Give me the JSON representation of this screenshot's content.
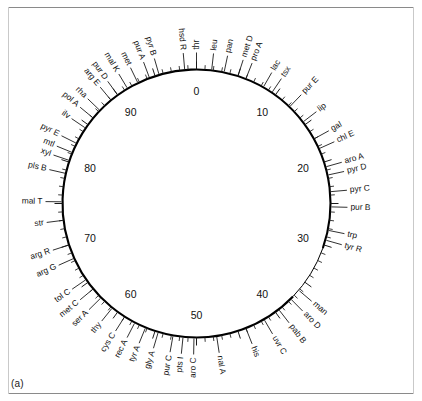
{
  "figure": {
    "panel_label": "(a)",
    "units": "minutes",
    "scale_max": 100
  },
  "scale_labels": [
    {
      "value": "0",
      "position": 0
    },
    {
      "value": "10",
      "position": 10
    },
    {
      "value": "20",
      "position": 20
    },
    {
      "value": "30",
      "position": 30
    },
    {
      "value": "40",
      "position": 40
    },
    {
      "value": "50",
      "position": 50
    },
    {
      "value": "60",
      "position": 60
    },
    {
      "value": "70",
      "position": 70
    },
    {
      "value": "80",
      "position": 80
    },
    {
      "value": "90",
      "position": 90
    }
  ],
  "genes": [
    {
      "label": "hsd R",
      "position": 98.6
    },
    {
      "label": "thr",
      "position": 0.0
    },
    {
      "label": "leu",
      "position": 1.8
    },
    {
      "label": "pan",
      "position": 3.3
    },
    {
      "label": "met D",
      "position": 5.0
    },
    {
      "label": "pro A",
      "position": 6.0
    },
    {
      "label": "lac",
      "position": 8.3
    },
    {
      "label": "tsx",
      "position": 9.5
    },
    {
      "label": "pur E",
      "position": 12.2
    },
    {
      "label": "lip",
      "position": 14.6
    },
    {
      "label": "gal",
      "position": 17.0
    },
    {
      "label": "chl E",
      "position": 18.3
    },
    {
      "label": "aro A",
      "position": 20.6
    },
    {
      "label": "pyr D",
      "position": 21.6
    },
    {
      "label": "pyr C",
      "position": 23.6
    },
    {
      "label": "pur B",
      "position": 25.4
    },
    {
      "label": "trp",
      "position": 28.2
    },
    {
      "label": "tyr R",
      "position": 29.4
    },
    {
      "label": "man",
      "position": 36.2
    },
    {
      "label": "aro D",
      "position": 37.6
    },
    {
      "label": "pab B",
      "position": 39.5
    },
    {
      "label": "uvr C",
      "position": 41.6
    },
    {
      "label": "his",
      "position": 44.0
    },
    {
      "label": "nal A",
      "position": 47.6
    },
    {
      "label": "aro C",
      "position": 50.3
    },
    {
      "label": "pts I",
      "position": 51.6
    },
    {
      "label": "pur C",
      "position": 52.8
    },
    {
      "label": "gly A",
      "position": 54.6
    },
    {
      "label": "tyr A",
      "position": 56.2
    },
    {
      "label": "rec A",
      "position": 57.6
    },
    {
      "label": "cys C",
      "position": 59.0
    },
    {
      "label": "thy",
      "position": 60.8
    },
    {
      "label": "ser A",
      "position": 62.6
    },
    {
      "label": "met C",
      "position": 64.0
    },
    {
      "label": "tol C",
      "position": 65.4
    },
    {
      "label": "arg G",
      "position": 68.3
    },
    {
      "label": "arg R",
      "position": 70.0
    },
    {
      "label": "str",
      "position": 73.0
    },
    {
      "label": "mal T",
      "position": 75.2
    },
    {
      "label": "pls B",
      "position": 78.6
    },
    {
      "label": "xyl",
      "position": 80.2
    },
    {
      "label": "mtl",
      "position": 81.2
    },
    {
      "label": "pyr E",
      "position": 82.4
    },
    {
      "label": "ilv",
      "position": 84.5
    },
    {
      "label": "pol A",
      "position": 86.0
    },
    {
      "label": "rha",
      "position": 87.2
    },
    {
      "label": "arg E",
      "position": 89.0
    },
    {
      "label": "pur D",
      "position": 90.0
    },
    {
      "label": "mal K",
      "position": 91.4
    },
    {
      "label": "met",
      "position": 92.8
    },
    {
      "label": "pur A",
      "position": 94.3
    },
    {
      "label": "pyr B",
      "position": 95.5
    }
  ],
  "colors": {
    "ring": "#000000",
    "text": "#111111",
    "background": "#ffffff",
    "frame": "#8a8a8a"
  },
  "chart_data": {
    "type": "scatter",
    "xlabel": "Map position (minutes)",
    "ylabel": "",
    "xlim": [
      0,
      100
    ],
    "grid": false,
    "legend": "none",
    "categories": [
      "hsd R",
      "thr",
      "leu",
      "pan",
      "met D",
      "pro A",
      "lac",
      "tsx",
      "pur E",
      "lip",
      "gal",
      "chl E",
      "aro A",
      "pyr D",
      "pyr C",
      "pur B",
      "trp",
      "tyr R",
      "man",
      "aro D",
      "pab B",
      "uvr C",
      "his",
      "nal A",
      "aro C",
      "pts I",
      "pur C",
      "gly A",
      "tyr A",
      "rec A",
      "cys C",
      "thy",
      "ser A",
      "met C",
      "tol C",
      "arg G",
      "arg R",
      "str",
      "mal T",
      "pls B",
      "xyl",
      "mtl",
      "pyr E",
      "ilv",
      "pol A",
      "rha",
      "arg E",
      "pur D",
      "mal K",
      "met",
      "pur A",
      "pyr B"
    ],
    "values": [
      98.6,
      0.0,
      1.8,
      3.3,
      5.0,
      6.0,
      8.3,
      9.5,
      12.2,
      14.6,
      17.0,
      18.3,
      20.6,
      21.6,
      23.6,
      25.4,
      28.2,
      29.4,
      36.2,
      37.6,
      39.5,
      41.6,
      44.0,
      47.6,
      50.3,
      51.6,
      52.8,
      54.6,
      56.2,
      57.6,
      59.0,
      60.8,
      62.6,
      64.0,
      65.4,
      68.3,
      70.0,
      73.0,
      75.2,
      78.6,
      80.2,
      81.2,
      82.4,
      84.5,
      86.0,
      87.2,
      89.0,
      90.0,
      91.4,
      92.8,
      94.3,
      95.5
    ],
    "tick_labels": [
      "0",
      "10",
      "20",
      "30",
      "40",
      "50",
      "60",
      "70",
      "80",
      "90"
    ],
    "tick_values": [
      0,
      10,
      20,
      30,
      40,
      50,
      60,
      70,
      80,
      90
    ]
  }
}
